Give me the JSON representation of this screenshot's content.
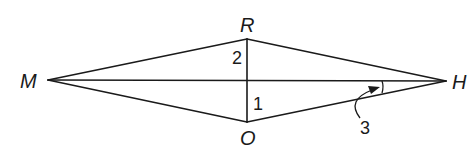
{
  "diagram": {
    "type": "kite/quadrilateral with diagonals",
    "colors": {
      "stroke": "#1a1a1a",
      "background": "#ffffff"
    },
    "vertices": {
      "M": {
        "label": "M",
        "x": 48,
        "y": 80
      },
      "R": {
        "label": "R",
        "x": 247,
        "y": 39
      },
      "H": {
        "label": "H",
        "x": 446,
        "y": 81
      },
      "O": {
        "label": "O",
        "x": 247,
        "y": 122
      }
    },
    "segments": [
      "MR",
      "RH",
      "HO",
      "OM",
      "MH",
      "RO"
    ],
    "angle_labels": {
      "angle1": {
        "label": "1",
        "at": "O, between OR and OH"
      },
      "angle2": {
        "label": "2",
        "at": "R, between RM and RO"
      },
      "angle3": {
        "label": "3",
        "at": "H, between HM and HO",
        "marker": "arc with curved arrow"
      }
    }
  }
}
